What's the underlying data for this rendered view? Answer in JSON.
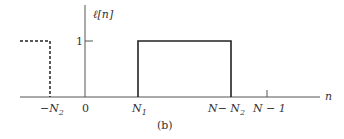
{
  "figure": {
    "caption": "(b)",
    "signal_label": "ℓ[n]",
    "axis": {
      "x_label": "n",
      "ticks": [
        {
          "name": "neg-N2",
          "text_main": "−N",
          "text_sub": "2"
        },
        {
          "name": "zero",
          "text_main": "0",
          "text_sub": ""
        },
        {
          "name": "N1",
          "text_main": "N",
          "text_sub": "1"
        },
        {
          "name": "N-minus-N2",
          "text_main": "N− N",
          "text_sub": "2"
        },
        {
          "name": "N-minus-1",
          "text_main": "N − 1",
          "text_sub": ""
        }
      ],
      "y_tick": "1"
    },
    "colors": {
      "line": "#222222",
      "axis": "#555555",
      "text": "#333333"
    }
  }
}
